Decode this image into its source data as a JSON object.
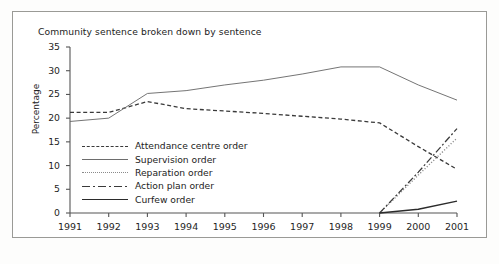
{
  "chart_data": {
    "type": "line",
    "title": "Community sentence broken down by sentence",
    "xlabel": "",
    "ylabel": "Percentage",
    "x": [
      1991,
      1992,
      1993,
      1994,
      1995,
      1996,
      1997,
      1998,
      1999,
      2000,
      2001
    ],
    "xtick_labels": [
      "1991",
      "1992",
      "1993",
      "1994",
      "1995",
      "1996",
      "1997",
      "1998",
      "1999",
      "2000",
      "2001"
    ],
    "ytick_labels": [
      "0",
      "5",
      "10",
      "15",
      "20",
      "25",
      "30",
      "35"
    ],
    "yticks": [
      0,
      5,
      10,
      15,
      20,
      25,
      30,
      35
    ],
    "ylim": [
      0,
      35
    ],
    "xlim": [
      1991,
      2001
    ],
    "grid": false,
    "legend_position": "inside-left",
    "series": [
      {
        "name": "Attendance centre order",
        "style": "dashed",
        "color": "#3a3a3a",
        "values": [
          21.2,
          21.2,
          23.5,
          22.0,
          21.5,
          21.0,
          20.4,
          19.8,
          19.0,
          14.0,
          9.2
        ]
      },
      {
        "name": "Supervision order",
        "style": "solid-thin",
        "color": "#6d6d6d",
        "values": [
          19.3,
          20.0,
          25.2,
          25.8,
          27.0,
          28.0,
          29.3,
          30.8,
          30.8,
          27.0,
          23.8
        ]
      },
      {
        "name": "Reparation order",
        "style": "dotted",
        "color": "#8a8a8a",
        "values": [
          0,
          0,
          0,
          0,
          0,
          0,
          0,
          0,
          0,
          8.0,
          15.8
        ]
      },
      {
        "name": "Action plan order",
        "style": "dash-dot",
        "color": "#3a3a3a",
        "values": [
          0,
          0,
          0,
          0,
          0,
          0,
          0,
          0,
          0,
          8.6,
          17.8
        ]
      },
      {
        "name": "Curfew order",
        "style": "solid-thick",
        "color": "#2b2b2b",
        "values": [
          0,
          0,
          0,
          0,
          0,
          0,
          0,
          0,
          0,
          0.8,
          2.5
        ]
      }
    ]
  }
}
